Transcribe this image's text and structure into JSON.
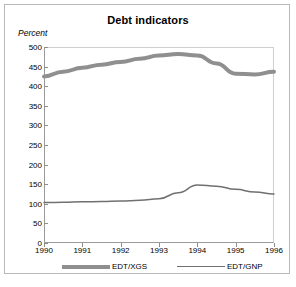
{
  "figure": {
    "title": "Debt indicators",
    "unit_label": "Percent",
    "background_color": "#ffffff",
    "frame_color": "#b9b9b9"
  },
  "chart_data": {
    "type": "line",
    "title": "Debt indicators",
    "subtitle": "",
    "xlabel": "",
    "ylabel": "Percent",
    "xlim": [
      1990,
      1996
    ],
    "ylim": [
      0,
      500
    ],
    "yticks": [
      0,
      50,
      100,
      150,
      200,
      250,
      300,
      350,
      400,
      450,
      500
    ],
    "ytick_labels": [
      "0",
      "50",
      "100",
      "150",
      "200",
      "250",
      "300",
      "350",
      "400",
      "450",
      "500"
    ],
    "xticks": [
      1990,
      1991,
      1992,
      1993,
      1994,
      1995,
      1996
    ],
    "xtick_labels": [
      "1990",
      "1991",
      "1992",
      "1993",
      "1994",
      "1995",
      "1996"
    ],
    "grid": false,
    "legend_position": "below",
    "x": [
      1990,
      1990.5,
      1991,
      1991.5,
      1992,
      1992.5,
      1993,
      1993.5,
      1994,
      1994.5,
      1995,
      1995.5,
      1996
    ],
    "series": [
      {
        "name": "EDT/XGS",
        "color": "#8f8f8f",
        "line_width": 4,
        "values": [
          425,
          437,
          447,
          455,
          462,
          470,
          478,
          482,
          478,
          458,
          432,
          430,
          437
        ]
      },
      {
        "name": "EDT/GNP",
        "color": "#707070",
        "line_width": 1.5,
        "values": [
          103,
          104,
          105,
          106,
          107,
          109,
          113,
          128,
          148,
          145,
          137,
          130,
          125
        ]
      }
    ],
    "annotations": []
  },
  "legend": {
    "entries": [
      {
        "label": "EDT/XGS",
        "style": "thick-line",
        "color": "#8f8f8f"
      },
      {
        "label": "EDT/GNP",
        "style": "thin-line",
        "color": "#707070"
      }
    ]
  }
}
